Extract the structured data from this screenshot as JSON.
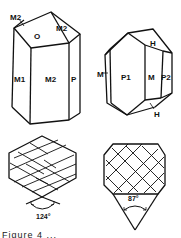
{
  "figure": {
    "crystals": [
      {
        "id": "crystal-left",
        "face_labels": [
          "M2",
          "O",
          "M2",
          "M1",
          "M2",
          "P"
        ]
      },
      {
        "id": "crystal-right",
        "face_labels": [
          "H",
          "M",
          "P1",
          "M",
          "P2",
          "H"
        ]
      }
    ],
    "cross_sections": [
      {
        "id": "section-left",
        "cleavage_angle": "124°"
      },
      {
        "id": "section-right",
        "cleavage_angle": "87°"
      }
    ],
    "caption": "Figure 4 ..."
  }
}
